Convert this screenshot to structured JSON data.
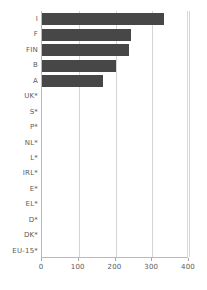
{
  "chart_data": {
    "type": "bar",
    "orientation": "horizontal",
    "title": "",
    "xlabel": "",
    "ylabel": "",
    "xlim": [
      0,
      400
    ],
    "ylim": null,
    "grid": true,
    "legend": null,
    "bar_color": "#474747",
    "xticks": [
      0,
      100,
      200,
      300,
      400
    ],
    "xtick_labels": [
      "0",
      "100",
      "200",
      "300",
      "400"
    ],
    "categories": [
      "I",
      "F",
      "FIN",
      "B",
      "A",
      "UK*",
      "S*",
      "P*",
      "NL*",
      "L*",
      "IRL*",
      "E*",
      "EL*",
      "D*",
      "DK*",
      "EU-15*"
    ],
    "values": [
      332,
      242,
      237,
      201,
      166,
      0,
      0,
      0,
      0,
      0,
      0,
      0,
      0,
      0,
      0,
      0
    ]
  },
  "axis": {
    "x_axis_line_color": "#b9b9b9",
    "gridline_color": "#d5d5d5",
    "tick_label_color": "#5a5a5a"
  }
}
